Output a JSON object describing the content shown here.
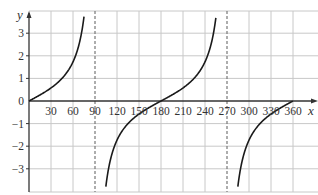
{
  "chart_data": {
    "type": "line",
    "title": "",
    "xlabel": "x",
    "ylabel": "y",
    "function": "y = tan x",
    "xlim": [
      0,
      375
    ],
    "ylim": [
      -4,
      4.2
    ],
    "x_ticks": [
      30,
      60,
      90,
      120,
      150,
      180,
      210,
      240,
      270,
      300,
      330,
      360
    ],
    "x_tick_labels": [
      "30",
      "60",
      "90",
      "120",
      "150",
      "180",
      "210",
      "240",
      "270",
      "300",
      "330",
      "360"
    ],
    "y_ticks": [
      -3,
      -2,
      -1,
      0,
      1,
      2,
      3
    ],
    "y_tick_labels": [
      "−3",
      "−2",
      "−1",
      "0",
      "1",
      "2",
      "3"
    ],
    "grid": true,
    "asymptotes": [
      90,
      270
    ],
    "series": [
      {
        "name": "branch-1",
        "x": [
          0,
          15,
          30,
          45,
          60,
          70,
          75
        ],
        "y": [
          0,
          0.27,
          0.58,
          1.0,
          1.73,
          2.75,
          3.73
        ]
      },
      {
        "name": "branch-2",
        "x": [
          105,
          110,
          120,
          135,
          150,
          165,
          180,
          195,
          210,
          225,
          240,
          250,
          255
        ],
        "y": [
          -3.73,
          -2.75,
          -1.73,
          -1.0,
          -0.58,
          -0.27,
          0,
          0.27,
          0.58,
          1.0,
          1.73,
          2.75,
          3.73
        ]
      },
      {
        "name": "branch-3",
        "x": [
          285,
          290,
          300,
          315,
          330,
          345,
          360
        ],
        "y": [
          -3.73,
          -2.75,
          -1.73,
          -1.0,
          -0.58,
          -0.27,
          0
        ]
      }
    ]
  },
  "style": {
    "curve_color": "#1a1a1a",
    "grid_color": "#c8c8c8",
    "axis_color": "#333333",
    "asymptote_color": "#777777"
  }
}
